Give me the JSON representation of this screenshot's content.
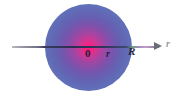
{
  "figure": {
    "name": "uniformly-charged-sphere-radial-axis-diagram",
    "background_color": "#ffffff",
    "width": 176,
    "height": 94
  },
  "sphere": {
    "name": "charged-sphere",
    "center_color": "#f0177f",
    "mid_color": "#7a4aa8",
    "edge_color": "#5b6cb6",
    "radius_px": 43,
    "center_x_px": 88,
    "center_y_px": 47
  },
  "axis": {
    "name": "radial-axis",
    "line_color": "#2e2e55",
    "outer_line_color": "#9a9aa6",
    "arrow_color": "#6c6c78",
    "y_px": 47,
    "start_x_px": 12,
    "end_x_px": 162
  },
  "labels": {
    "origin": "0",
    "radius_variable": "r",
    "sphere_radius": "R",
    "axis_variable": "r"
  }
}
